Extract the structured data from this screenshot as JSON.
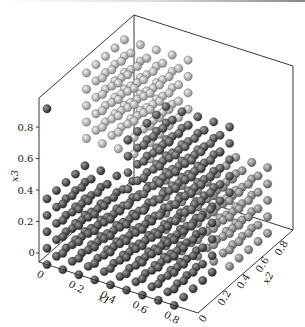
{
  "chart_data": {
    "type": "scatter",
    "projection": "3d",
    "title": "",
    "xlabel": "x1",
    "ylabel": "x2",
    "zlabel": "x3",
    "xlim": [
      0,
      1
    ],
    "ylim": [
      0,
      1
    ],
    "zlim": [
      0,
      1
    ],
    "xticks": [
      "0",
      "0.2",
      "0.4",
      "0.6",
      "0.8"
    ],
    "yticks": [
      "0",
      "0.2",
      "0.4",
      "0.6",
      "0.8"
    ],
    "zticks": [
      "0",
      "0.2",
      "0.4",
      "0.6",
      "0.8"
    ],
    "grid": false,
    "legend": "none",
    "series": [
      {
        "name": "cluster-dark-low",
        "color": "#3a3a3a",
        "x1": [
          0.05,
          0.85
        ],
        "x2": [
          0.0,
          0.4
        ],
        "x3": [
          0.0,
          0.4
        ],
        "step": 0.1
      },
      {
        "name": "cluster-light-high",
        "color": "#b8b8b8",
        "x1": [
          0.0,
          0.4
        ],
        "x2": [
          0.5,
          0.9
        ],
        "x3": [
          0.5,
          0.9
        ],
        "step": 0.1
      },
      {
        "name": "cluster-medium",
        "color": "#8a8a8a",
        "x1": [
          0.5,
          0.9
        ],
        "x2": [
          0.5,
          0.9
        ],
        "x3": [
          0.0,
          0.4
        ],
        "step": 0.1
      },
      {
        "name": "cluster-dark-mid",
        "color": "#4a4a4a",
        "x1": [
          0.5,
          0.9
        ],
        "x2": [
          0.1,
          0.5
        ],
        "x3": [
          0.45,
          0.85
        ],
        "step": 0.1
      },
      {
        "name": "outlier",
        "color": "#3a3a3a",
        "points": [
          [
            0.05,
            0.0,
            0.95
          ]
        ]
      }
    ]
  }
}
